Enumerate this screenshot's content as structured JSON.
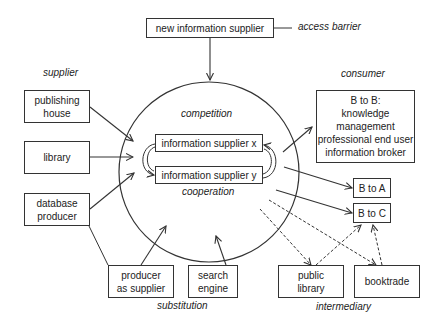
{
  "diagram": {
    "top": {
      "new_supplier": "new information supplier",
      "access_barrier": "access barrier"
    },
    "supplier": {
      "heading": "supplier",
      "items": [
        "publishing\nhouse",
        "library",
        "database\nproducer"
      ]
    },
    "center": {
      "competition": "competition",
      "cooperation": "cooperation",
      "supplier_x": "information supplier x",
      "supplier_y": "information supplier y"
    },
    "consumer": {
      "heading": "consumer",
      "b2b": "B to B:\nknowledge\nmanagement\nprofessional end user\ninformation broker",
      "b2a": "B to A",
      "b2c": "B to C"
    },
    "substitution": {
      "label": "substitution",
      "producer": "producer\nas supplier",
      "search": "search\nengine"
    },
    "intermediary": {
      "label": "intermediary",
      "public_library": "public\nlibrary",
      "booktrade": "booktrade"
    },
    "colors": {
      "stroke": "#333333",
      "text": "#222222",
      "background": "#ffffff"
    }
  }
}
